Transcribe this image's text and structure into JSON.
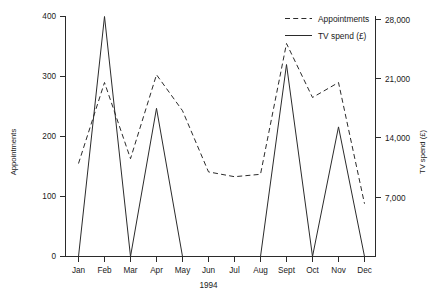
{
  "chart_data": {
    "type": "line",
    "title": "",
    "subtitle": "",
    "xlabel": "1994",
    "ylabel": "Appointments",
    "y2label": "TV spend (£)",
    "grid": false,
    "legend_position": "top-right",
    "categories": [
      "Jan",
      "Feb",
      "Mar",
      "Apr",
      "May",
      "Jun",
      "Jul",
      "Aug",
      "Sept",
      "Oct",
      "Nov",
      "Dec"
    ],
    "ylim": [
      0,
      400
    ],
    "yticks": [
      0,
      100,
      200,
      300,
      400
    ],
    "yticklabels": [
      "0",
      "100",
      "200",
      "300",
      "400"
    ],
    "y2lim": [
      0,
      28000
    ],
    "y2ticks": [
      7000,
      14000,
      21000,
      28000
    ],
    "y2ticklabels": [
      "7,000",
      "14,000",
      "21,000",
      "28,000"
    ],
    "series": [
      {
        "name": "Appointments",
        "style": "dashed",
        "axis": "left",
        "values": [
          155,
          290,
          163,
          303,
          243,
          141,
          133,
          137,
          355,
          265,
          290,
          88
        ]
      },
      {
        "name": "TV spend (£)",
        "style": "solid",
        "axis": "right",
        "values": [
          0,
          28000,
          0,
          17300,
          0,
          0,
          0,
          0,
          22400,
          0,
          15100,
          0
        ],
        "values_left_scale": [
          0,
          400,
          0,
          247,
          0,
          0,
          0,
          0,
          320,
          0,
          216,
          0
        ]
      }
    ]
  },
  "legend": {
    "entries": [
      {
        "label": "Appointments",
        "style": "dashed"
      },
      {
        "label": "TV spend (£)",
        "style": "solid"
      }
    ]
  },
  "axes": {
    "left_title": "Appointments",
    "right_title": "TV spend (£)",
    "x_unit": "1994"
  }
}
